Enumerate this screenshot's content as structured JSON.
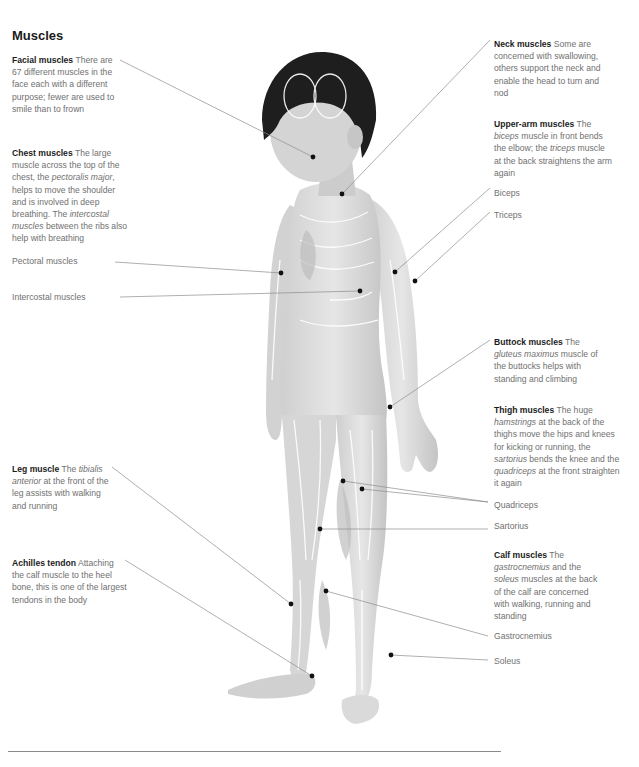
{
  "page": {
    "title": "Muscles"
  },
  "annotations": {
    "facial": {
      "heading": "Facial muscles",
      "body": " There are 67 different muscles in the face each with a different purpose; fewer are used to smile than to frown"
    },
    "chest": {
      "heading": "Chest muscles",
      "body_1": " The large muscle across the top of the chest, the ",
      "italic_1": "pectoralis major",
      "body_2": ", helps to move the shoulder and is involved in deep breathing. The ",
      "italic_2": "intercostal muscles",
      "body_3": " between the ribs also help with breathing"
    },
    "neck": {
      "heading": "Neck muscles",
      "body": " Some are concerned with swallowing, others support the neck and enable the head to turn and nod"
    },
    "upper_arm": {
      "heading": "Upper-arm muscles",
      "body_1": " The ",
      "italic_1": "biceps",
      "body_2": " muscle in front bends the elbow; the ",
      "italic_2": "triceps",
      "body_3": " muscle at the back straightens the arm again"
    },
    "buttock": {
      "heading": "Buttock muscles",
      "body_1": " The ",
      "italic_1": "gluteus maximus",
      "body_2": " muscle of the buttocks helps with standing and climbing"
    },
    "thigh": {
      "heading": "Thigh muscles",
      "body_1": " The huge ",
      "italic_1": "hamstrings",
      "body_2": " at the back of the thighs move the hips and knees for kicking or running, the ",
      "italic_2": "sartorius",
      "body_3": " bends the knee and the ",
      "italic_3": "quadriceps",
      "body_4": " at the front straighten it again"
    },
    "leg": {
      "heading": "Leg muscle",
      "body_1": " The ",
      "italic_1": "tibialis anterior",
      "body_2": " at the front of the leg assists with walking and running"
    },
    "achilles": {
      "heading": "Achilles tendon",
      "body": " Attaching the calf muscle to the heel bone, this is one of the largest tendons in the body"
    },
    "calf": {
      "heading": "Calf muscles",
      "body_1": " The ",
      "italic_1": "gastrocnemius",
      "body_2": " and the ",
      "italic_2": "soleus",
      "body_3": " muscles at the back of the calf are concerned with walking, running and standing"
    }
  },
  "labels": {
    "pectoral": "Pectoral muscles",
    "intercostal": "Intercostal muscles",
    "biceps": "Biceps",
    "triceps": "Triceps",
    "quadriceps": "Quadriceps",
    "sartorius": "Sartorius",
    "gastrocnemius": "Gastrocnemius",
    "soleus": "Soleus"
  },
  "colors": {
    "hair": "#1e1e1e",
    "skin_muscle": "#d8d8d8",
    "muscle_shade": "#bdbdbd",
    "muscle_line": "#ffffff",
    "leader_line": "#8c8c8c",
    "marker_dot": "#111111"
  }
}
